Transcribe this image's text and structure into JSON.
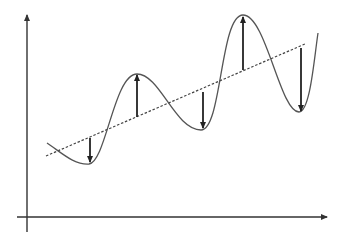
{
  "diagram": {
    "type": "line",
    "colors": {
      "axis": "#333333",
      "curve": "#555555",
      "trend": "#444444",
      "arrow": "#222222",
      "background": "#ffffff"
    },
    "axes": {
      "y_axis": {
        "x": 27,
        "y_top": 15,
        "y_bottom": 232,
        "arrow": "up"
      },
      "x_axis": {
        "y": 217,
        "x_left": 17,
        "x_right": 327,
        "arrow": "right"
      },
      "tick_labels": [],
      "xlabel": "",
      "ylabel": ""
    },
    "trend_line": {
      "style": "dashed",
      "start": [
        46,
        156
      ],
      "end": [
        305,
        44
      ]
    },
    "curve": {
      "style": "solid",
      "points": [
        [
          47,
          143
        ],
        [
          89,
          164
        ],
        [
          137,
          74
        ],
        [
          201,
          130
        ],
        [
          243,
          15
        ],
        [
          299,
          112
        ],
        [
          318,
          33
        ]
      ]
    },
    "residual_arrows": [
      {
        "x": 90,
        "from_y": 138,
        "to_y": 162,
        "direction": "down"
      },
      {
        "x": 137,
        "from_y": 117,
        "to_y": 75,
        "direction": "up"
      },
      {
        "x": 203,
        "from_y": 92,
        "to_y": 128,
        "direction": "down"
      },
      {
        "x": 243,
        "from_y": 70,
        "to_y": 17,
        "direction": "up"
      },
      {
        "x": 301,
        "from_y": 48,
        "to_y": 111,
        "direction": "down"
      }
    ]
  }
}
